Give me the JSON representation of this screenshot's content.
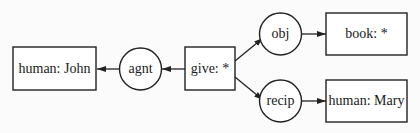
{
  "diagram": {
    "type": "conceptual-graph",
    "concepts": [
      {
        "id": "john",
        "label": "human: John"
      },
      {
        "id": "give",
        "label": "give: *"
      },
      {
        "id": "book",
        "label": "book: *"
      },
      {
        "id": "mary",
        "label": "human: Mary"
      }
    ],
    "relations": [
      {
        "id": "agnt",
        "label": "agnt"
      },
      {
        "id": "obj",
        "label": "obj"
      },
      {
        "id": "recip",
        "label": "recip"
      }
    ],
    "edges": [
      {
        "from": "give",
        "to": "agnt"
      },
      {
        "from": "agnt",
        "to": "john"
      },
      {
        "from": "give",
        "to": "obj"
      },
      {
        "from": "obj",
        "to": "book"
      },
      {
        "from": "give",
        "to": "recip"
      },
      {
        "from": "recip",
        "to": "mary"
      }
    ]
  }
}
